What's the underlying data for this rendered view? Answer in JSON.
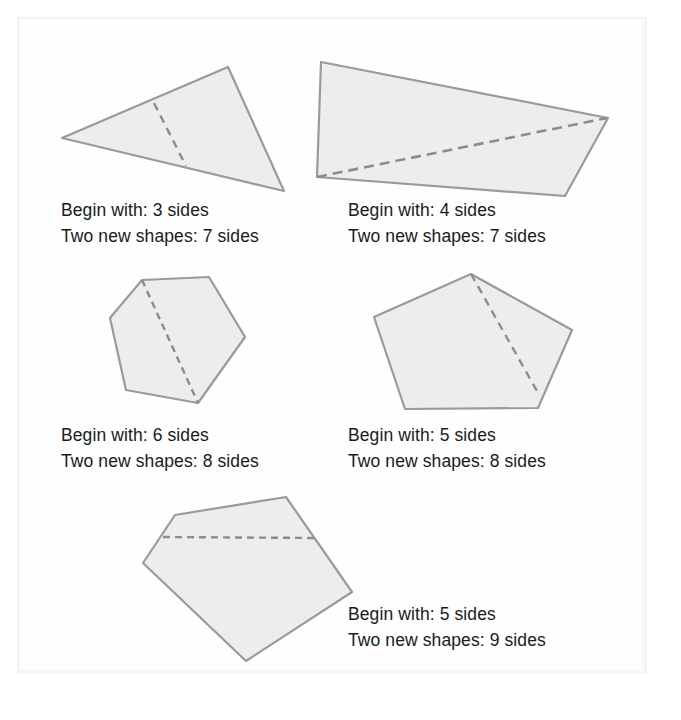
{
  "figure": {
    "fill_color": "#ededed",
    "stroke_color": "#9a9a9a",
    "dash_color": "#8c8c8c",
    "text_color": "#1a1a1a",
    "page_background": "#ffffff",
    "labels": {
      "begin_prefix": "Begin with:",
      "result_prefix": "Two new shapes:",
      "unit": "sides"
    },
    "items": [
      {
        "id": "shape-triangle",
        "shape": "triangle",
        "begin_sides": 3,
        "new_sides": 7,
        "begin_text": "Begin with: 3 sides",
        "result_text": "Two new shapes: 7 sides",
        "points": "62,138 228,67 284,191",
        "cut": "154,103 186,166"
      },
      {
        "id": "shape-quadrilateral",
        "shape": "quadrilateral",
        "begin_sides": 4,
        "new_sides": 7,
        "begin_text": "Begin with: 4 sides",
        "result_text": "Two new shapes: 7 sides",
        "points": "321,62 608,118 565,196 317,177",
        "cut": "317,177 607,118"
      },
      {
        "id": "shape-hexagon",
        "shape": "hexagon",
        "begin_sides": 6,
        "new_sides": 8,
        "begin_text": "Begin with: 6 sides",
        "result_text": "Two new shapes: 8 sides",
        "points": "142,280 209,277 245,337 198,403 126,390 110,318",
        "cut": "142,280 198,403"
      },
      {
        "id": "shape-pentagon",
        "shape": "pentagon",
        "begin_sides": 5,
        "new_sides": 8,
        "begin_text": "Begin with: 5 sides",
        "result_text": "Two new shapes: 8 sides",
        "points": "471,274 572,330 538,408 405,409 374,317",
        "cut": "471,274 537,391"
      },
      {
        "id": "shape-pentagon-wide",
        "shape": "pentagon",
        "begin_sides": 5,
        "new_sides": 9,
        "begin_text": "Begin with: 5 sides",
        "result_text": "Two new shapes: 9 sides",
        "points": "175,515 286,497 352,592 246,661 143,563",
        "cut": "163,537 317,538"
      }
    ]
  }
}
